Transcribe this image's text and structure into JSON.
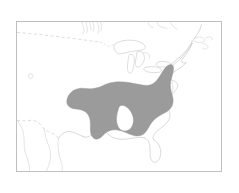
{
  "figure": {
    "kind": "species-range-map",
    "region": "Eastern North America",
    "background_color": "#ffffff",
    "frame": {
      "color": "#b9b9b9",
      "x": 16,
      "y": 21,
      "width": 206,
      "height": 151
    },
    "legend_present": false,
    "labels_present": false,
    "title": "",
    "caption": ""
  },
  "map": {
    "projection_note": "",
    "coastline_color": "#c2c2c2",
    "border_color": "#cfcfcf",
    "lake_fill": "#ffffff",
    "features": [
      {
        "name": "canada-us-border",
        "style": "dashed"
      },
      {
        "name": "us-mexico-border",
        "style": "dashed"
      },
      {
        "name": "great-lakes",
        "style": "outline"
      },
      {
        "name": "atlantic-coast",
        "style": "outline"
      },
      {
        "name": "gulf-coast",
        "style": "outline"
      },
      {
        "name": "florida-peninsula",
        "style": "outline"
      },
      {
        "name": "hudson-bay-lakes",
        "style": "outline"
      }
    ]
  },
  "range": {
    "label": "Shaded distribution range",
    "fill_color": "#9b9b9b",
    "coverage_description": "Southeastern and eastern United States",
    "interior_gap": "Mississippi alluvial valley notch"
  }
}
